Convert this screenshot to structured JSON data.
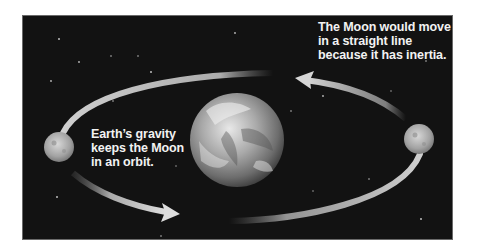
{
  "diagram": {
    "colors": {
      "background": "#121212",
      "arrow": "#cfcfcf",
      "text": "#f2f2f2",
      "page": "#ffffff"
    },
    "objects": [
      {
        "id": "earth",
        "label": "Earth",
        "cx": 236,
        "cy": 139,
        "r": 47
      },
      {
        "id": "moon-left",
        "label": "Moon",
        "cx": 58,
        "cy": 146,
        "r": 15
      },
      {
        "id": "moon-right",
        "label": "Moon",
        "cx": 418,
        "cy": 138,
        "r": 15
      }
    ],
    "captions": {
      "inertia": {
        "lines": [
          "The Moon would move",
          "in a straight line",
          "because it has inertia."
        ]
      },
      "gravity": {
        "lines": [
          "Earth’s gravity",
          "keeps the Moon",
          "in an orbit."
        ]
      }
    },
    "arrows": [
      {
        "id": "arrow-top",
        "direction": "counterclockwise",
        "description": "arrow from right moon curving up-left toward top of orbit"
      },
      {
        "id": "arrow-bottom",
        "direction": "counterclockwise",
        "description": "arrow from left moon curving down-right toward bottom of orbit"
      }
    ]
  }
}
